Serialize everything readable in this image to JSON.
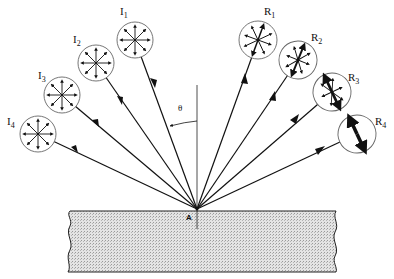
{
  "diagram": {
    "point_label": "A",
    "angle_label": "θ",
    "incident_rays": [
      {
        "label": "I",
        "sub": "1",
        "cx": 135,
        "cy": 40,
        "r": 18,
        "polarization": "unpolarized"
      },
      {
        "label": "I",
        "sub": "2",
        "cx": 96,
        "cy": 63,
        "r": 18,
        "polarization": "unpolarized"
      },
      {
        "label": "I",
        "sub": "3",
        "cx": 62,
        "cy": 95,
        "r": 18,
        "polarization": "unpolarized"
      },
      {
        "label": "I",
        "sub": "4",
        "cx": 38,
        "cy": 134,
        "r": 18,
        "polarization": "unpolarized"
      }
    ],
    "reflected_rays": [
      {
        "label": "R",
        "sub": "1",
        "cx": 258,
        "cy": 40,
        "r": 19,
        "polarization": "slightly polarized"
      },
      {
        "label": "R",
        "sub": "2",
        "cx": 298,
        "cy": 60,
        "r": 19,
        "polarization": "partially polarized"
      },
      {
        "label": "R",
        "sub": "3",
        "cx": 332,
        "cy": 92,
        "r": 19,
        "polarization": "mostly polarized"
      },
      {
        "label": "R",
        "sub": "4",
        "cx": 357,
        "cy": 134,
        "r": 19,
        "polarization": "plane polarized"
      }
    ],
    "colors": {
      "line": "#111111",
      "slab_fill": "#d9d9d9",
      "circle": "#555555"
    }
  }
}
